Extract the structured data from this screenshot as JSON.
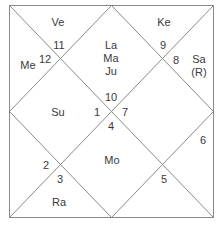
{
  "chart_title": "North Indian Birth Chart",
  "colors": {
    "line": "#8a8a8a",
    "text": "#3a3a3a",
    "background": "#ffffff"
  },
  "houses": [
    {
      "house": 1,
      "sign": "10",
      "planets": [
        "La",
        "Ma",
        "Ju"
      ]
    },
    {
      "house": 2,
      "sign": "11",
      "planets": [
        "Ve"
      ]
    },
    {
      "house": 3,
      "sign": "12",
      "planets": [
        "Me"
      ]
    },
    {
      "house": 4,
      "sign": "1",
      "planets": [
        "Su"
      ]
    },
    {
      "house": 5,
      "sign": "2",
      "planets": []
    },
    {
      "house": 6,
      "sign": "3",
      "planets": [
        "Ra"
      ]
    },
    {
      "house": 7,
      "sign": "4",
      "planets": [
        "Mo"
      ]
    },
    {
      "house": 8,
      "sign": "5",
      "planets": []
    },
    {
      "house": 9,
      "sign": "6",
      "planets": []
    },
    {
      "house": 10,
      "sign": "7",
      "planets": []
    },
    {
      "house": 11,
      "sign": "8",
      "planets": [
        "Sa",
        "(R)"
      ]
    },
    {
      "house": 12,
      "sign": "9",
      "planets": [
        "Ke"
      ]
    }
  ]
}
